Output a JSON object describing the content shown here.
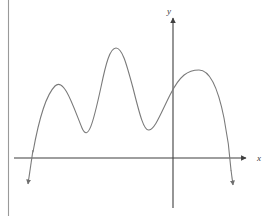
{
  "figure": {
    "kind": "math-function-graph",
    "background_color": "#ffffff",
    "curve_color": "#7a7a7a",
    "axis_color": "#3f3f3f",
    "margin_rule_color": "#9a9a9a",
    "width": 275,
    "height": 216
  },
  "axes": {
    "x_axis": {
      "label": "x",
      "label_x": 259,
      "label_y": 161,
      "line_y": 158,
      "line_x_start": 14,
      "line_x_end": 246,
      "arrow": "right"
    },
    "y_axis": {
      "label": "y",
      "label_x": 169,
      "label_y": 14,
      "line_x": 173,
      "line_y_start": 208,
      "line_y_end": 18,
      "arrow": "up"
    },
    "origin": {
      "x": 173,
      "y": 158
    }
  },
  "margin_rule": {
    "name": "left-margin-rule",
    "x": 8,
    "y_start": 0,
    "y_end": 216
  },
  "chart_data": {
    "type": "line",
    "title": "",
    "xlabel": "x",
    "ylabel": "y",
    "grid": false,
    "legend": null,
    "features": {
      "local_maxima": [
        {
          "label": "peak-1",
          "x": 55,
          "y": 86
        },
        {
          "label": "peak-2",
          "x": 115,
          "y": 48
        },
        {
          "label": "peak-3",
          "x": 199,
          "y": 70
        }
      ],
      "local_minima": [
        {
          "label": "valley-1",
          "x": 82,
          "y": 128
        },
        {
          "label": "valley-2",
          "x": 149,
          "y": 130
        }
      ],
      "x_intercepts": [
        {
          "label": "left-root",
          "x": 31,
          "y": 158
        },
        {
          "label": "right-root",
          "x": 230,
          "y": 158
        }
      ],
      "tail_ends": [
        {
          "label": "left-tail-arrow",
          "x": 28,
          "y": 189
        },
        {
          "label": "right-tail-arrow",
          "x": 233,
          "y": 190
        }
      ]
    },
    "path_points": [
      {
        "x": 33,
        "y": 152
      },
      {
        "x": 40,
        "y": 120
      },
      {
        "x": 46,
        "y": 100
      },
      {
        "x": 51,
        "y": 90
      },
      {
        "x": 55,
        "y": 86
      },
      {
        "x": 60,
        "y": 88
      },
      {
        "x": 66,
        "y": 98
      },
      {
        "x": 72,
        "y": 114
      },
      {
        "x": 78,
        "y": 125
      },
      {
        "x": 83,
        "y": 128
      },
      {
        "x": 89,
        "y": 124
      },
      {
        "x": 95,
        "y": 110
      },
      {
        "x": 101,
        "y": 87
      },
      {
        "x": 107,
        "y": 64
      },
      {
        "x": 112,
        "y": 51
      },
      {
        "x": 117,
        "y": 48
      },
      {
        "x": 123,
        "y": 54
      },
      {
        "x": 129,
        "y": 71
      },
      {
        "x": 136,
        "y": 96
      },
      {
        "x": 142,
        "y": 118
      },
      {
        "x": 148,
        "y": 130
      },
      {
        "x": 154,
        "y": 128
      },
      {
        "x": 160,
        "y": 117
      },
      {
        "x": 167,
        "y": 100
      },
      {
        "x": 174,
        "y": 88
      },
      {
        "x": 181,
        "y": 79
      },
      {
        "x": 189,
        "y": 72
      },
      {
        "x": 199,
        "y": 70
      },
      {
        "x": 208,
        "y": 73
      },
      {
        "x": 216,
        "y": 85
      },
      {
        "x": 223,
        "y": 112
      },
      {
        "x": 228,
        "y": 142
      },
      {
        "x": 231,
        "y": 168
      },
      {
        "x": 233,
        "y": 185
      }
    ]
  }
}
